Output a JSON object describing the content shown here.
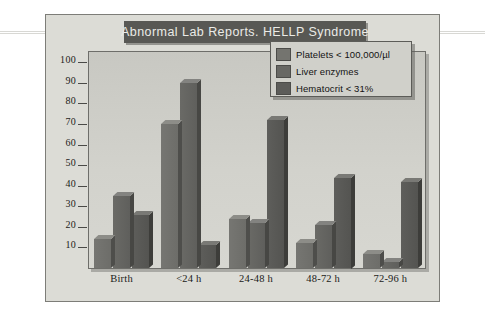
{
  "title": "Abnormal Lab Reports. HELLP Syndrome",
  "legend": {
    "items": [
      {
        "label": "Platelets < 100,000/µl",
        "swatch": "#74746f"
      },
      {
        "label": "Liver enzymes",
        "swatch": "#686864"
      },
      {
        "label": "Hematocrit < 31%",
        "swatch": "#5c5c59"
      }
    ]
  },
  "axis": {
    "y_ticks": [
      "100",
      "90",
      "80",
      "70",
      "60",
      "50",
      "40",
      "30",
      "20",
      "10"
    ],
    "x_labels": [
      "Birth",
      "<24 h",
      "24-48 h",
      "48-72 h",
      "72-96 h"
    ]
  },
  "colors": {
    "page_background": "#ffffff",
    "figure_background": "#dcdcd6",
    "plot_background": "#d2d2cc",
    "title_banner": "#585854",
    "title_text": "#ebebe7",
    "frame_border": "#6e6e6a"
  },
  "chart_data": {
    "type": "bar",
    "title": "Abnormal Lab Reports. HELLP Syndrome",
    "xlabel": "",
    "ylabel": "",
    "ylim": [
      0,
      105
    ],
    "grid": false,
    "legend_position": "top-right",
    "categories": [
      "Birth",
      "<24 h",
      "24-48 h",
      "48-72 h",
      "72-96 h"
    ],
    "series": [
      {
        "name": "Platelets < 100,000/µl",
        "values": [
          14,
          70,
          24,
          12,
          7
        ]
      },
      {
        "name": "Liver enzymes",
        "values": [
          35,
          90,
          22,
          21,
          3
        ]
      },
      {
        "name": "Hematocrit < 31%",
        "values": [
          26,
          11,
          72,
          44,
          42
        ]
      }
    ]
  }
}
